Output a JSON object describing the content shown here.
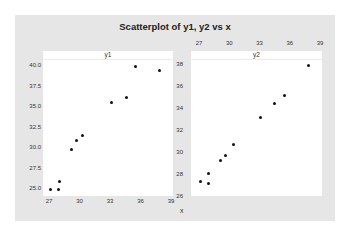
{
  "chart_data": {
    "type": "scatter",
    "title": "Scatterplot of y1, y2 vs x",
    "xlabel": "x",
    "panels": [
      {
        "name": "y1",
        "ylabel": "y1",
        "x_ticks": [
          "27",
          "30",
          "33",
          "36",
          "39"
        ],
        "y_ticks": [
          "25.0",
          "27.5",
          "30.0",
          "32.5",
          "35.0",
          "37.5",
          "40.0"
        ],
        "xlim": [
          27,
          39
        ],
        "ylim": [
          25,
          40
        ],
        "x_axis_position": "bottom",
        "points": [
          {
            "x": 27.1,
            "y": 25.0
          },
          {
            "x": 27.9,
            "y": 25.0
          },
          {
            "x": 28.0,
            "y": 25.9
          },
          {
            "x": 29.2,
            "y": 29.8
          },
          {
            "x": 29.7,
            "y": 30.9
          },
          {
            "x": 30.3,
            "y": 31.5
          },
          {
            "x": 33.1,
            "y": 35.5
          },
          {
            "x": 34.6,
            "y": 36.2
          },
          {
            "x": 35.5,
            "y": 40.0
          },
          {
            "x": 37.9,
            "y": 39.4
          }
        ]
      },
      {
        "name": "y2",
        "ylabel": "y2",
        "x_ticks": [
          "27",
          "30",
          "33",
          "36",
          "39"
        ],
        "y_ticks": [
          "26",
          "28",
          "30",
          "32",
          "34",
          "36",
          "38"
        ],
        "xlim": [
          27,
          39
        ],
        "ylim": [
          26,
          38
        ],
        "x_axis_position": "top",
        "points": [
          {
            "x": 27.1,
            "y": 27.4
          },
          {
            "x": 27.9,
            "y": 27.2
          },
          {
            "x": 27.9,
            "y": 28.1
          },
          {
            "x": 29.1,
            "y": 29.3
          },
          {
            "x": 29.6,
            "y": 29.8
          },
          {
            "x": 30.4,
            "y": 30.8
          },
          {
            "x": 33.1,
            "y": 33.2
          },
          {
            "x": 34.5,
            "y": 34.5
          },
          {
            "x": 35.5,
            "y": 35.2
          },
          {
            "x": 37.9,
            "y": 38.0
          }
        ]
      }
    ],
    "grid": false,
    "legend": "none"
  },
  "colors": {
    "background": "#e6e6e6",
    "panel": "#ffffff",
    "point": "#111111"
  }
}
